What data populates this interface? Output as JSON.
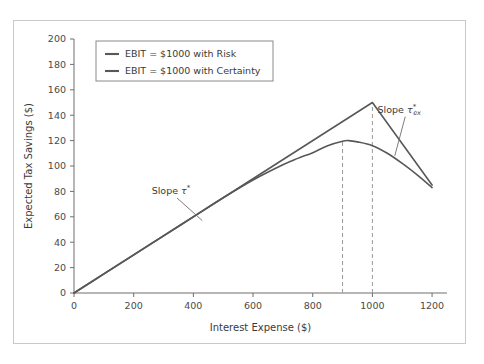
{
  "figure": {
    "background_color": "#ffffff",
    "frame_color": "#c9c9c9"
  },
  "chart_data": {
    "type": "line",
    "title": "",
    "subtitle": "",
    "xlabel": "Interest Expense ($)",
    "ylabel": "Expected Tax Savings ($)",
    "xlim": [
      0,
      1250
    ],
    "ylim": [
      0,
      200
    ],
    "xticks": [
      0,
      200,
      400,
      600,
      800,
      1000,
      1200
    ],
    "xtick_labels": [
      "0",
      "200",
      "400",
      "600",
      "800",
      "1000",
      "1200"
    ],
    "yticks": [
      0,
      20,
      40,
      60,
      80,
      100,
      120,
      140,
      160,
      180,
      200
    ],
    "ytick_labels": [
      "0",
      "20",
      "40",
      "60",
      "80",
      "100",
      "120",
      "140",
      "160",
      "180",
      "200"
    ],
    "grid": false,
    "legend_position": "upper left",
    "line_color": "#585858",
    "dashline_color": "#9a9a9a",
    "series": [
      {
        "name": "EBIT = $1000 with Risk",
        "color": "#585858",
        "style": "smooth-curve",
        "points": [
          [
            0,
            0
          ],
          [
            100,
            15
          ],
          [
            200,
            30
          ],
          [
            300,
            45
          ],
          [
            400,
            60
          ],
          [
            500,
            75
          ],
          [
            600,
            89
          ],
          [
            700,
            101
          ],
          [
            750,
            106
          ],
          [
            800,
            110.5
          ],
          [
            850,
            116
          ],
          [
            900,
            119.5
          ],
          [
            920,
            120
          ],
          [
            950,
            119
          ],
          [
            1000,
            116
          ],
          [
            1050,
            110
          ],
          [
            1100,
            102
          ],
          [
            1150,
            93
          ],
          [
            1200,
            83
          ]
        ]
      },
      {
        "name": "EBIT = $1000 with Certainty",
        "color": "#585858",
        "style": "piecewise-linear",
        "points": [
          [
            0,
            0
          ],
          [
            1000,
            150
          ],
          [
            1200,
            85
          ]
        ]
      }
    ],
    "reference_lines": [
      {
        "name": "risk-peak-dropline",
        "x": 900,
        "y_from": 0,
        "y_to": 120,
        "style": "dashed"
      },
      {
        "name": "certainty-peak-dropline",
        "x": 1000,
        "y_from": 0,
        "y_to": 150,
        "style": "dashed"
      }
    ],
    "annotations": [
      {
        "name": "slope-tau-star",
        "text_prefix": "Slope ",
        "symbol": "τ",
        "superscript": "*",
        "subscript": "",
        "text_x": 325,
        "text_y": 78,
        "anchor_x": 430,
        "anchor_y": 57
      },
      {
        "name": "slope-tau-star-ex",
        "text_prefix": "Slope ",
        "symbol": "τ",
        "superscript": "*",
        "subscript": "ex",
        "text_x": 1090,
        "text_y": 142,
        "anchor_x": 1075,
        "anchor_y": 108
      }
    ]
  },
  "legend": {
    "items": [
      {
        "label": "EBIT = $1000 with Risk",
        "color": "#585858"
      },
      {
        "label": "EBIT = $1000 with Certainty",
        "color": "#585858"
      }
    ]
  }
}
